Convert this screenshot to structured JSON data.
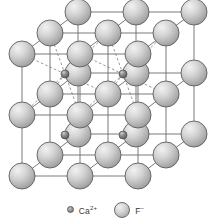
{
  "figure": {
    "background_color": "#ffffff",
    "edge_color": "#6b6b6b",
    "dashed_bond_color": "#777777",
    "cell": {
      "origin_x": 22,
      "origin_y": 176,
      "edge_x": 116,
      "edge_y_up": 122,
      "depth_x": 56,
      "depth_y": -42,
      "divisions": 2
    },
    "anion": {
      "symbol": "F",
      "charge": "-",
      "label": "F⁻",
      "radius": 13,
      "fill_light": "#f2f2f2",
      "fill_mid": "#d4d4d4",
      "fill_dark": "#9b9b9b",
      "stroke": "#5e5e5e",
      "count": 27
    },
    "cation": {
      "symbol": "Ca",
      "charge": "2+",
      "label": "Ca²⁺",
      "radius": 4,
      "fill_light": "#cfcfcf",
      "fill_mid": "#8f8f8f",
      "fill_dark": "#5a5a5a",
      "stroke": "#4a4a4a",
      "count": 4
    },
    "lattice_points": {
      "comment": "fractional (i,j,k) on a 0..2 grid; i=right, j=up, k=depth",
      "anion_grid": [
        0,
        1,
        2
      ],
      "cation_sites": [
        {
          "i": 0.5,
          "j": 1.5,
          "k": 0.5,
          "bonds": true
        },
        {
          "i": 1.5,
          "j": 1.5,
          "k": 0.5,
          "bonds": true
        },
        {
          "i": 0.5,
          "j": 0.5,
          "k": 0.5,
          "bonds": false
        },
        {
          "i": 1.5,
          "j": 0.5,
          "k": 0.5,
          "bonds": false
        }
      ]
    }
  },
  "legend": {
    "items": [
      {
        "name": "cation",
        "label": "Ca",
        "sup": "2+",
        "marker": "small-sphere"
      },
      {
        "name": "anion",
        "label": "F",
        "sup": "−",
        "marker": "large-sphere"
      }
    ]
  }
}
